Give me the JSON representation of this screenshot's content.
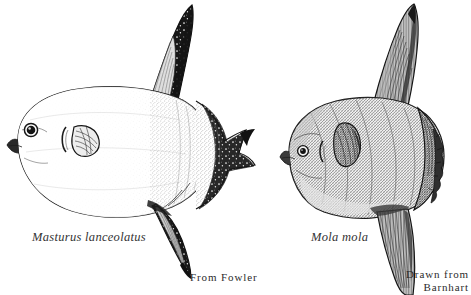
{
  "plate": {
    "width": 471,
    "height": 295,
    "background_color": "#ffffff",
    "ink_color": "#1a1a1a",
    "subject": "comparative-illustration-of-two-ocean-sunfish-species",
    "figure_count": 2
  },
  "figures": [
    {
      "id": "left",
      "species_label": "Masturus lanceolatus",
      "credit_label": "From Fowler",
      "common_identity": "sharptail-mola",
      "orientation": "facing-left",
      "rendering_style": "stippled-line-engraving",
      "features": {
        "dorsal_fin": "tall dark falcate fin with pale speckles",
        "anal_fin": "tall dark pointed fin with pale speckles",
        "clavus": "clavus bearing a pointed central lobe projection",
        "eye": "round dark eye with pale iris ring",
        "pectoral_fin": "small hatched fan-shaped pectoral fin",
        "gill_slit": "short crescent gill opening anterior to pectoral fin",
        "body_outline": "broad oval laterally compressed body"
      }
    },
    {
      "id": "right",
      "species_label": "Mola mola",
      "credit_label_line1": "Drawn from",
      "credit_label_line2": "Barnhart",
      "common_identity": "ocean-sunfish",
      "orientation": "facing-left",
      "rendering_style": "dense-cross-hatched-engraving",
      "features": {
        "dorsal_fin": "tall triangular striated fin",
        "anal_fin": "tall triangular striated fin",
        "clavus": "rounded clavus with scalloped trailing margin",
        "eye": "small round dark eye with pale ring",
        "pectoral_fin": "dark hatched teardrop pectoral fin",
        "gill_slit": "small comma-shaped gill opening",
        "body_outline": "rounded laterally compressed body"
      }
    }
  ],
  "colors": {
    "ink": "#1a1a1a",
    "mid_ink": "#555555",
    "light_ink": "#8a8a8a",
    "paper": "#ffffff",
    "caption_text": "#2e2e2e"
  }
}
